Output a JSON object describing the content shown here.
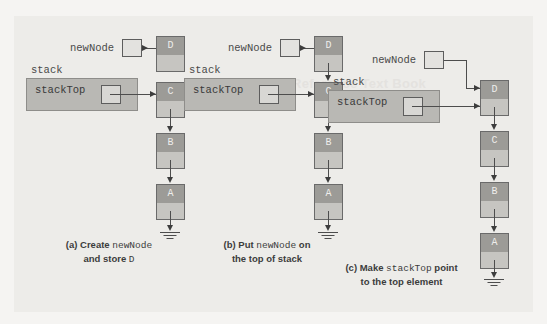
{
  "figure": {
    "background_color": "#edece9",
    "node_data_color": "#9c9b97",
    "node_link_color": "#c6c5c1",
    "stack_box_color": "#b9b8b4",
    "line_color": "#4d4d4d"
  },
  "watermark": {
    "text": "Reference Text Book"
  },
  "panels": [
    {
      "id": "a",
      "newnode_label": "newNode",
      "stack_label": "stack",
      "stacktop_label": "stackTop",
      "nodes": [
        {
          "value": "D"
        },
        {
          "value": "C"
        },
        {
          "value": "B"
        },
        {
          "value": "A"
        }
      ],
      "caption_line1_pre": "(a) Create ",
      "caption_line1_mono": "newNode",
      "caption_line1_post": "",
      "caption_line2_pre": "and store ",
      "caption_line2_mono": "D",
      "caption_line2_post": ""
    },
    {
      "id": "b",
      "newnode_label": "newNode",
      "stack_label": "stack",
      "stacktop_label": "stackTop",
      "nodes": [
        {
          "value": "D"
        },
        {
          "value": "C"
        },
        {
          "value": "B"
        },
        {
          "value": "A"
        }
      ],
      "caption_line1_pre": "(b) Put ",
      "caption_line1_mono": "newNode",
      "caption_line1_post": " on",
      "caption_line2_pre": "the top of stack",
      "caption_line2_mono": "",
      "caption_line2_post": ""
    },
    {
      "id": "c",
      "newnode_label": "newNode",
      "stack_label": "stack",
      "stacktop_label": "stackTop",
      "nodes": [
        {
          "value": "D"
        },
        {
          "value": "C"
        },
        {
          "value": "B"
        },
        {
          "value": "A"
        }
      ],
      "caption_line1_pre": "(c) Make ",
      "caption_line1_mono": "stackTop",
      "caption_line1_post": " point",
      "caption_line2_pre": "to the top element",
      "caption_line2_mono": "",
      "caption_line2_post": ""
    }
  ]
}
